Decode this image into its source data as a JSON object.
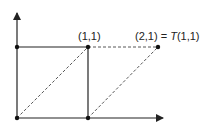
{
  "diagram": {
    "labels": {
      "point_11": "(1,1)",
      "point_21": "(2,1) = ",
      "point_21_T": "T",
      "point_21_arg": "(1,1)"
    },
    "points": [
      {
        "name": "origin",
        "x": 0,
        "y": 0
      },
      {
        "name": "e1",
        "x": 1,
        "y": 0
      },
      {
        "name": "e2",
        "x": 0,
        "y": 1
      },
      {
        "name": "p11",
        "x": 1,
        "y": 1
      },
      {
        "name": "p21",
        "x": 2,
        "y": 1
      }
    ],
    "colors": {
      "line": "#222222",
      "dashed": "#444444"
    }
  }
}
